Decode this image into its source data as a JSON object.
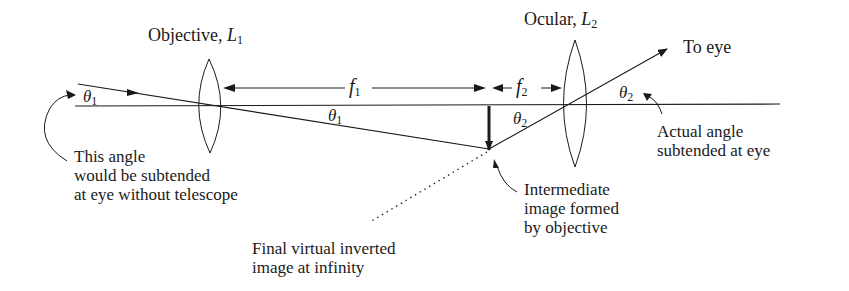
{
  "diagram": {
    "type": "refracting telescope ray diagram",
    "colors": {
      "ink": "#1a1a1a",
      "background": "#ffffff"
    },
    "lenses": {
      "objective": {
        "label": "Objective, ",
        "symbol": "L",
        "subscript": "1"
      },
      "ocular": {
        "label": "Ocular, ",
        "symbol": "L",
        "subscript": "2"
      }
    },
    "focal_lengths": {
      "f1": {
        "symbol": "f",
        "subscript": "1"
      },
      "f2": {
        "symbol": "f",
        "subscript": "2"
      }
    },
    "angles": {
      "theta1_left": {
        "symbol": "θ",
        "subscript": "1"
      },
      "theta1_mid": {
        "symbol": "θ",
        "subscript": "1"
      },
      "theta2_mid": {
        "symbol": "θ",
        "subscript": "2"
      },
      "theta2_right": {
        "symbol": "θ",
        "subscript": "2"
      }
    },
    "annotations": {
      "to_eye": "To eye",
      "actual_angle": [
        "Actual angle",
        "subtended at eye"
      ],
      "without_telescope": [
        "This angle",
        "would be subtended",
        "at eye without telescope"
      ],
      "intermediate_image": [
        "Intermediate",
        "image formed",
        "by objective"
      ],
      "final_image": [
        "Final virtual inverted",
        "image at infinity"
      ]
    }
  }
}
